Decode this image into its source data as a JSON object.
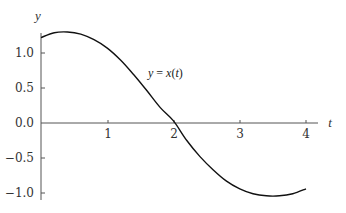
{
  "chart_data": {
    "type": "line",
    "title": "",
    "xlabel": "t",
    "ylabel": "y",
    "xlim": [
      0,
      4.2
    ],
    "ylim": [
      -1.1,
      1.35
    ],
    "grid": false,
    "x_ticks": [
      1,
      2,
      3,
      4
    ],
    "x_tick_labels": [
      "1",
      "2",
      "3",
      "4"
    ],
    "y_ticks": [
      1.0,
      0.5,
      0.0,
      -0.5,
      -1.0
    ],
    "y_tick_labels": [
      "1.0",
      "0.5",
      "0.0",
      "-0.5",
      "-1.0"
    ],
    "series": [
      {
        "name": "y = x(t)",
        "x": [
          0,
          0.2,
          0.4,
          0.6,
          0.8,
          1.0,
          1.2,
          1.4,
          1.6,
          1.8,
          2.0,
          2.2,
          2.4,
          2.6,
          2.8,
          3.0,
          3.2,
          3.4,
          3.6,
          3.8,
          4.0
        ],
        "values": [
          1.22,
          1.29,
          1.3,
          1.27,
          1.19,
          1.07,
          0.9,
          0.69,
          0.46,
          0.22,
          0.03,
          -0.25,
          -0.48,
          -0.67,
          -0.83,
          -0.94,
          -1.01,
          -1.04,
          -1.04,
          -1.01,
          -0.94
        ]
      }
    ],
    "annotations": [
      {
        "text": "y = x(t)",
        "x": 1.5,
        "y": 0.75
      }
    ]
  },
  "labels": {
    "x_axis": "t",
    "y_axis": "y",
    "curve": "y = x(t)",
    "xt1": "1",
    "xt2": "2",
    "xt3": "3",
    "xt4": "4",
    "yt1": "1.0",
    "yt2": "0.5",
    "yt3": "0.0",
    "yt4": "−0.5",
    "yt5": "−1.0"
  }
}
